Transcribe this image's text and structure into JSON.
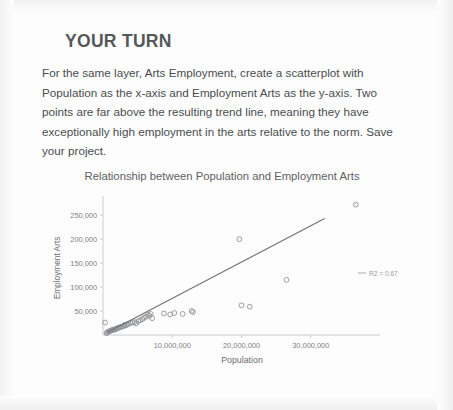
{
  "heading": "YOUR TURN",
  "body_text": "For the same layer, Arts Employment, create a scatterplot with Population as the x-axis and Employment Arts as the y-axis. Two points are far above the resulting trend line, meaning they have exceptionally high employment in the arts relative to the norm. Save your project.",
  "colors": {
    "heading": "#55585a",
    "body": "#4a4d4f",
    "axis": "#c9cbcd",
    "point_stroke": "#8f9294",
    "trendline": "#6e7173",
    "page_background": "#fdfdfd"
  },
  "chart_data": {
    "type": "scatter",
    "title": "Relationship between Population and Employment Arts",
    "xlabel": "Population",
    "ylabel": "Employment Arts",
    "xlim": [
      0,
      40000000
    ],
    "ylim": [
      0,
      290000
    ],
    "xticks": [
      10000000,
      20000000,
      30000000
    ],
    "xtick_labels": [
      "10,000,000",
      "20,000,000",
      "30,000,000"
    ],
    "yticks": [
      50000,
      100000,
      150000,
      200000,
      250000
    ],
    "ytick_labels": [
      "50,000",
      "100,000",
      "150,000",
      "200,000",
      "250,000"
    ],
    "grid": false,
    "legend": {
      "position": "right",
      "entries": [
        {
          "label": "R2 = 0.67",
          "marker": "line"
        }
      ]
    },
    "annotations": [
      {
        "text": "R2 = 0.67",
        "x": 32500000,
        "y": 135000
      }
    ],
    "trendline": {
      "type": "linear",
      "r_squared": 0.67,
      "x": [
        600000,
        32000000
      ],
      "y": [
        5000,
        243000
      ]
    },
    "series": [
      {
        "name": "States",
        "marker": "open-circle",
        "points": [
          [
            300000,
            26000
          ],
          [
            500000,
            4000
          ],
          [
            600000,
            5000
          ],
          [
            700000,
            6500
          ],
          [
            850000,
            7000
          ],
          [
            950000,
            8000
          ],
          [
            1100000,
            9000
          ],
          [
            1250000,
            9500
          ],
          [
            1350000,
            10500
          ],
          [
            1500000,
            11000
          ],
          [
            1650000,
            12000
          ],
          [
            1750000,
            11500
          ],
          [
            1900000,
            13000
          ],
          [
            2050000,
            14000
          ],
          [
            2200000,
            15000
          ],
          [
            2400000,
            16000
          ],
          [
            2600000,
            17000
          ],
          [
            2800000,
            17500
          ],
          [
            3000000,
            19000
          ],
          [
            3100000,
            21000
          ],
          [
            3300000,
            20000
          ],
          [
            3500000,
            22000
          ],
          [
            3700000,
            23000
          ],
          [
            4000000,
            25000
          ],
          [
            4300000,
            26000
          ],
          [
            4600000,
            27000
          ],
          [
            4800000,
            24000
          ],
          [
            5100000,
            29000
          ],
          [
            5400000,
            31000
          ],
          [
            5700000,
            33000
          ],
          [
            5900000,
            36000
          ],
          [
            6200000,
            38000
          ],
          [
            6500000,
            42000
          ],
          [
            6700000,
            40000
          ],
          [
            6900000,
            44000
          ],
          [
            7100000,
            35000
          ],
          [
            8800000,
            45000
          ],
          [
            9700000,
            43000
          ],
          [
            10300000,
            46000
          ],
          [
            11500000,
            44000
          ],
          [
            12800000,
            50000
          ],
          [
            13000000,
            48000
          ],
          [
            19700000,
            200000
          ],
          [
            20000000,
            62000
          ],
          [
            21200000,
            59000
          ],
          [
            26500000,
            115000
          ],
          [
            36500000,
            272000
          ]
        ]
      }
    ]
  }
}
